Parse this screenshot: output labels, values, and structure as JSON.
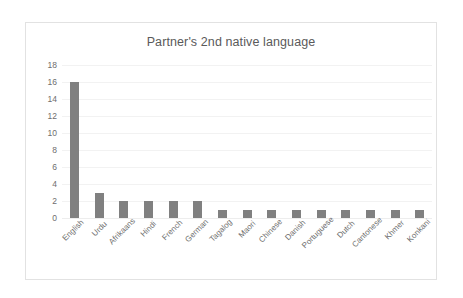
{
  "chart_data": {
    "type": "bar",
    "title": "Partner's 2nd native language",
    "xlabel": "",
    "ylabel": "",
    "categories": [
      "English",
      "Urdu",
      "Afrikaans",
      "Hindi",
      "French",
      "German",
      "Tagalog",
      "Maori",
      "Chinese",
      "Danish",
      "Portuguese",
      "Dutch",
      "Cantonese",
      "Khmer",
      "Konkani"
    ],
    "values": [
      16,
      3,
      2,
      2,
      2,
      2,
      1,
      1,
      1,
      1,
      1,
      1,
      1,
      1,
      1
    ],
    "ylim": [
      0,
      18
    ],
    "ytick_labels": [
      "18",
      "16",
      "14",
      "12",
      "10",
      "8",
      "6",
      "4",
      "2",
      "0"
    ],
    "ytick_values": [
      18,
      16,
      14,
      12,
      10,
      8,
      6,
      4,
      2,
      0
    ],
    "grid": true,
    "legend": false,
    "bar_color": "#808080",
    "text_color": "#6e6e6e",
    "title_color": "#5a5a5a",
    "gridline_color": "#f2f2f2",
    "border_color": "#e2e2e2",
    "background": "#ffffff"
  }
}
